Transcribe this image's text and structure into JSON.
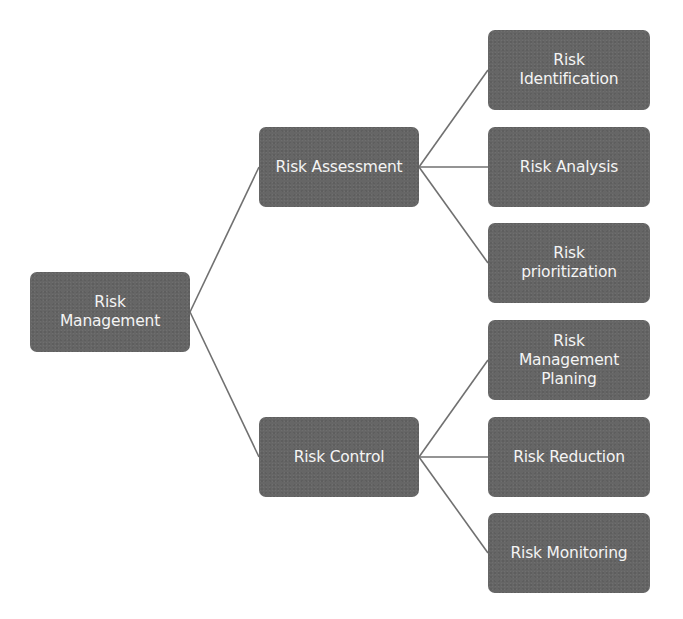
{
  "diagram": {
    "type": "hierarchy-tree",
    "root": {
      "id": "risk-management",
      "label": "Risk\nManagement"
    },
    "branches": [
      {
        "id": "risk-assessment",
        "label": "Risk Assessment",
        "children": [
          {
            "id": "risk-identification",
            "label": "Risk\nIdentification"
          },
          {
            "id": "risk-analysis",
            "label": "Risk Analysis"
          },
          {
            "id": "risk-prioritization",
            "label": "Risk\nprioritization"
          }
        ]
      },
      {
        "id": "risk-control",
        "label": "Risk Control",
        "children": [
          {
            "id": "risk-management-planing",
            "label": "Risk\nManagement\nPlaning"
          },
          {
            "id": "risk-reduction",
            "label": "Risk Reduction"
          },
          {
            "id": "risk-monitoring",
            "label": "Risk Monitoring"
          }
        ]
      }
    ],
    "colors": {
      "node_fill": "#666666",
      "node_text": "#f4f4f4",
      "connector": "#6e6e6e",
      "background": "#ffffff"
    }
  }
}
